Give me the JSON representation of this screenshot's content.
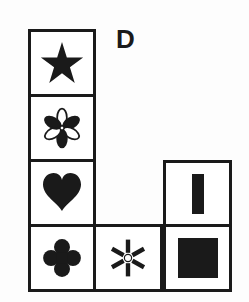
{
  "figure": {
    "label": "D",
    "ink_color": "#1a1a1a",
    "cells": [
      {
        "column": 1,
        "row": 1,
        "symbol": "star",
        "style": "filled"
      },
      {
        "column": 1,
        "row": 2,
        "symbol": "six-petal-flower",
        "style": "alternating filled/outline petals"
      },
      {
        "column": 1,
        "row": 3,
        "symbol": "heart",
        "style": "filled"
      },
      {
        "column": 1,
        "row": 4,
        "symbol": "four-leaf-clover",
        "style": "filled"
      },
      {
        "column": 2,
        "row": 4,
        "symbol": "asterisk-with-hollow-center",
        "style": "filled"
      },
      {
        "column": 3,
        "row": 3,
        "symbol": "vertical-bar",
        "style": "filled"
      },
      {
        "column": 3,
        "row": 4,
        "symbol": "square",
        "style": "filled"
      }
    ]
  }
}
